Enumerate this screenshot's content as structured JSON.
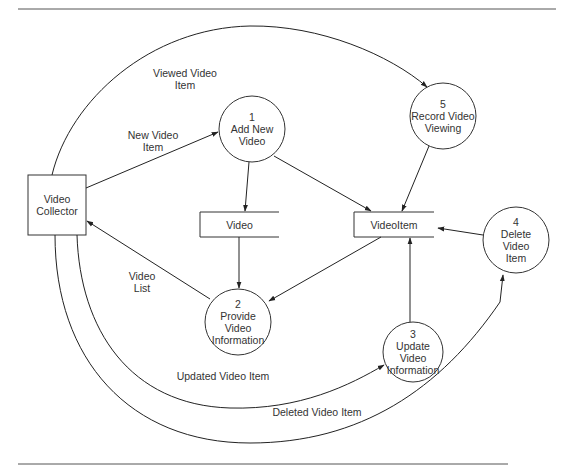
{
  "diagram": {
    "type": "data-flow-diagram",
    "external_entities": [
      {
        "id": "collector",
        "label": "Video\nCollector"
      }
    ],
    "processes": [
      {
        "id": "p1",
        "number": "1",
        "label": "1\nAdd New\nVideo"
      },
      {
        "id": "p2",
        "number": "2",
        "label": "2\nProvide\nVideo\nInformation"
      },
      {
        "id": "p3",
        "number": "3",
        "label": "3\nUpdate\nVideo\nInformation"
      },
      {
        "id": "p4",
        "number": "4",
        "label": "4\nDelete\nVideo\nItem"
      },
      {
        "id": "p5",
        "number": "5",
        "label": "5\nRecord Video\nViewing"
      }
    ],
    "data_stores": [
      {
        "id": "video",
        "label": "Video"
      },
      {
        "id": "videoitem",
        "label": "VideoItem"
      }
    ],
    "flows": [
      {
        "from": "collector",
        "to": "p1",
        "label": "New Video\nItem"
      },
      {
        "from": "collector",
        "to": "p5",
        "label": "Viewed Video\nItem"
      },
      {
        "from": "p2",
        "to": "collector",
        "label": "Video\nList"
      },
      {
        "from": "collector",
        "to": "p3",
        "label": "Updated  Video Item"
      },
      {
        "from": "collector",
        "to": "p4",
        "label": "Deleted  Video Item"
      },
      {
        "from": "p1",
        "to": "video",
        "label": ""
      },
      {
        "from": "p1",
        "to": "videoitem",
        "label": ""
      },
      {
        "from": "p5",
        "to": "videoitem",
        "label": ""
      },
      {
        "from": "p4",
        "to": "videoitem",
        "label": ""
      },
      {
        "from": "p3",
        "to": "videoitem",
        "label": ""
      },
      {
        "from": "video",
        "to": "p2",
        "label": ""
      },
      {
        "from": "videoitem",
        "to": "p2",
        "label": ""
      }
    ]
  }
}
